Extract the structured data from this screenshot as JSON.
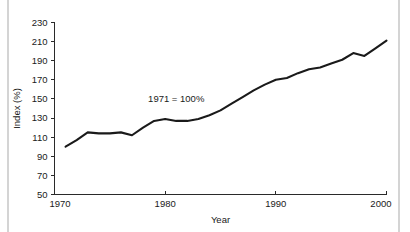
{
  "chart_data": {
    "type": "line",
    "title": "",
    "subtitle": "",
    "xlabel": "Year",
    "ylabel": "Index (%)",
    "xlim": [
      1970,
      2000
    ],
    "ylim": [
      50,
      230
    ],
    "grid": false,
    "legend": null,
    "annotations": [
      {
        "text": "1971 = 100%",
        "x": 1981,
        "y": 147
      }
    ],
    "x_ticks": [
      1970,
      1980,
      1990,
      2000
    ],
    "x_tick_labels": [
      "1970",
      "1980",
      "1990",
      "2000"
    ],
    "y_ticks": [
      50,
      70,
      90,
      110,
      130,
      150,
      170,
      190,
      210,
      230
    ],
    "y_tick_labels": [
      "50",
      "70",
      "90",
      "110",
      "130",
      "150",
      "170",
      "190",
      "210",
      "230"
    ],
    "series": [
      {
        "name": "Index",
        "color": "#1a1a1a",
        "x": [
          1971,
          1972,
          1973,
          1974,
          1975,
          1976,
          1977,
          1978,
          1979,
          1980,
          1981,
          1982,
          1983,
          1984,
          1985,
          1986,
          1987,
          1988,
          1989,
          1990,
          1991,
          1992,
          1993,
          1994,
          1995,
          1996,
          1997,
          1998,
          1999,
          2000
        ],
        "values": [
          100,
          107,
          115,
          114,
          114,
          115,
          112,
          120,
          127,
          129,
          127,
          127,
          129,
          133,
          138,
          145,
          152,
          159,
          165,
          170,
          172,
          177,
          181,
          183,
          187,
          191,
          198,
          195,
          203,
          211
        ]
      }
    ]
  },
  "axes": {
    "x_axis_name": "year-axis",
    "y_axis_name": "index-axis"
  }
}
